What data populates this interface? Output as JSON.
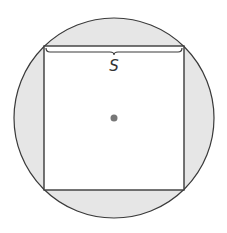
{
  "diagram": {
    "type": "square-inscribed-in-circle",
    "side_label": "S",
    "colors": {
      "circle_fill": "#e6e6e6",
      "square_fill": "#ffffff",
      "stroke": "#3a3a3a",
      "center_dot": "#777777"
    },
    "shapes": {
      "circle": {
        "cx": 114,
        "cy": 118,
        "r": 100
      },
      "square": {
        "x": 44,
        "y": 46,
        "width": 140,
        "height": 144
      },
      "center_point": {
        "cx": 114,
        "cy": 118
      }
    }
  }
}
